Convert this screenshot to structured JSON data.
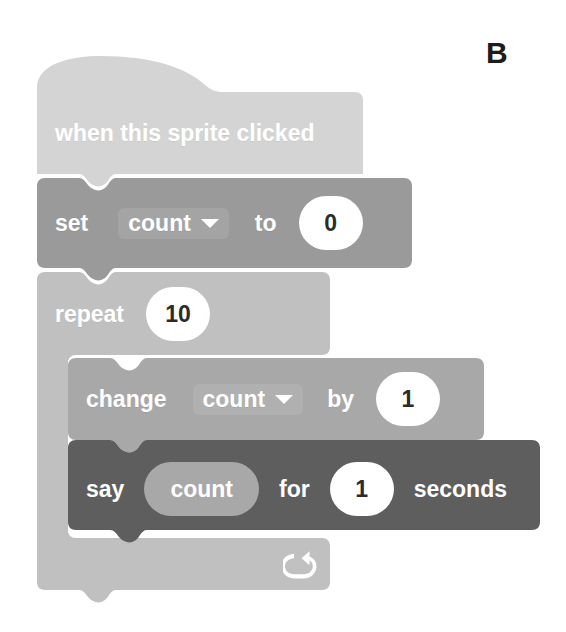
{
  "panel": {
    "letter": "B"
  },
  "colors": {
    "hat_block": "#d4d4d4",
    "set_block": "#9a9a9a",
    "repeat_block": "#c0c0c0",
    "change_block": "#a8a8a8",
    "say_block": "#5e5e5e",
    "reporter_pill": "#a8a8a8",
    "input_oval": "#ffffff",
    "label_text": "#ffffff",
    "input_text": "#2b2b2b",
    "page_background": "#ffffff",
    "panel_letter": "#1c1c1c"
  },
  "script": {
    "name": "scratch-block-script",
    "blocks": [
      {
        "id": "when-this-sprite-clicked",
        "kind": "hat",
        "label": "when this sprite clicked"
      },
      {
        "id": "set-variable",
        "kind": "stack",
        "label_before": "set",
        "variable": "count",
        "label_middle": "to",
        "value": "0"
      },
      {
        "id": "repeat",
        "kind": "c-block",
        "label": "repeat",
        "value": "10",
        "loop_icon": "loop-arrow-icon"
      },
      {
        "id": "change-variable",
        "kind": "stack",
        "label_before": "change",
        "variable": "count",
        "label_middle": "by",
        "value": "1"
      },
      {
        "id": "say-for-seconds",
        "kind": "stack",
        "label_before": "say",
        "reporter": "count",
        "label_middle": "for",
        "value": "1",
        "label_after": "seconds"
      }
    ]
  }
}
